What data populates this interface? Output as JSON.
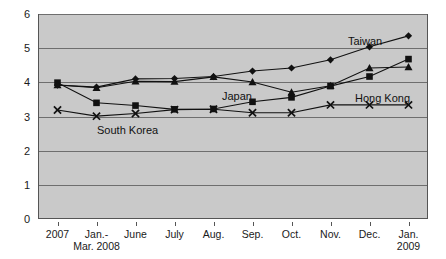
{
  "chart_data": {
    "type": "line",
    "title": "",
    "xlabel": "",
    "ylabel": "",
    "ylim": [
      0,
      6
    ],
    "y_ticks": [
      0,
      1,
      2,
      3,
      4,
      5,
      6
    ],
    "grid": true,
    "legend_position": "inline-annotations",
    "categories": [
      "2007",
      "Jan.-\nMar. 2008",
      "June",
      "July",
      "Aug.",
      "Sep.",
      "Oct.",
      "Nov.",
      "Dec.",
      "Jan.\n2009"
    ],
    "series": [
      {
        "name": "Taiwan",
        "marker": "diamond",
        "values": [
          3.92,
          3.86,
          4.1,
          4.11,
          4.17,
          4.33,
          4.42,
          4.66,
          5.04,
          5.36
        ]
      },
      {
        "name": "Hong Kong",
        "marker": "square",
        "values": [
          3.99,
          3.4,
          3.32,
          3.21,
          3.22,
          3.43,
          3.56,
          3.89,
          4.17,
          4.68
        ]
      },
      {
        "name": "Japan",
        "marker": "triangle",
        "values": [
          3.92,
          3.84,
          4.03,
          4.02,
          4.16,
          4.01,
          3.71,
          3.9,
          4.42,
          4.45
        ]
      },
      {
        "name": "South Korea",
        "marker": "cross",
        "values": [
          3.19,
          3.01,
          3.09,
          3.2,
          3.21,
          3.11,
          3.11,
          3.34,
          3.34,
          3.34
        ]
      }
    ],
    "annotations": [
      {
        "text": "Taiwan",
        "x_px": 348,
        "y_px": 35
      },
      {
        "text": "Japan",
        "x_px": 222,
        "y_px": 90
      },
      {
        "text": "Hong Kong",
        "x_px": 355,
        "y_px": 92
      },
      {
        "text": "South Korea",
        "x_px": 97,
        "y_px": 124
      }
    ],
    "colors": {
      "plot_background": "#c9c9c9",
      "gridline": "#6e6e6e",
      "series_line": "#111111",
      "axis": "#555555",
      "text": "#1a1a1a",
      "page_background": "#ffffff"
    }
  }
}
